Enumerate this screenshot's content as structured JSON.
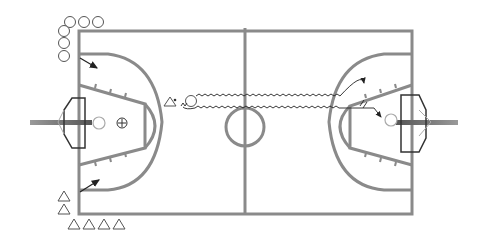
{
  "diagram": {
    "type": "basketball-drill",
    "court_color": "#8a8a8a",
    "marker_color": "#555555",
    "arrow_color": "#222222"
  },
  "players": {
    "offense_circles_top_row": 3,
    "offense_circles_left_column": 3,
    "defense_triangles_bottom_row": 4,
    "defense_triangles_left_column": 2
  },
  "symbols": {
    "ball_holder": "triangle-with-dot",
    "coach": "circle",
    "plus_marker": "⊕"
  },
  "actions": [
    {
      "name": "cut-arrow-top-left"
    },
    {
      "name": "cut-arrow-bottom-left"
    },
    {
      "name": "dribble-path-upper"
    },
    {
      "name": "dribble-path-lower-with-screen"
    }
  ]
}
